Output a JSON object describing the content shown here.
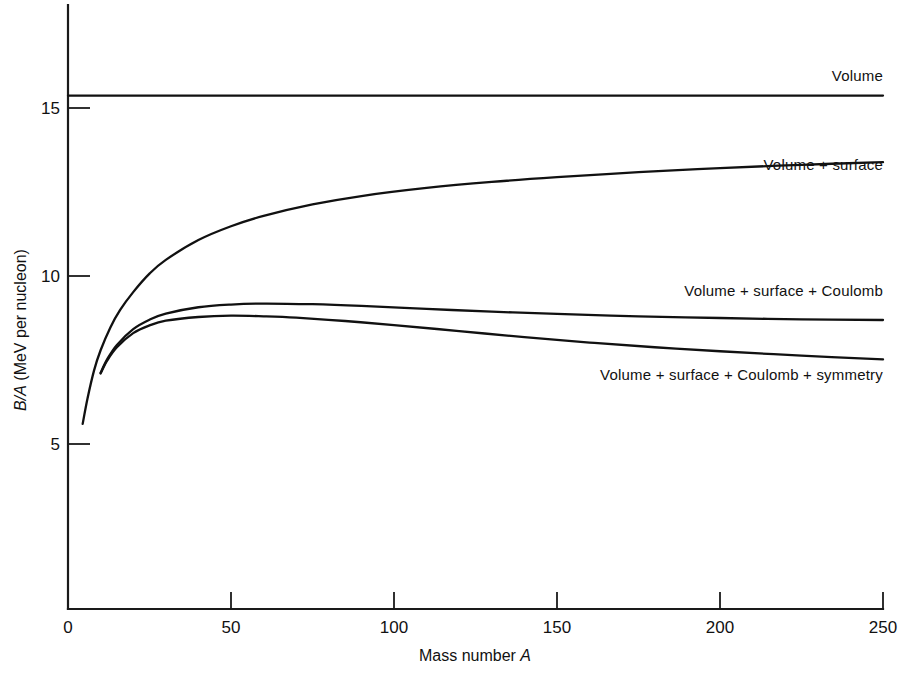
{
  "chart_data": {
    "type": "line",
    "title": "",
    "xlabel": "Mass number A",
    "ylabel": "B/A (MeV per nucleon)",
    "xlim": [
      0,
      250
    ],
    "ylim": [
      0,
      16.8
    ],
    "grid": false,
    "legend_position": "inline-right-of-curve",
    "xticks": [
      0,
      50,
      100,
      150,
      200,
      250
    ],
    "xtick_labels": [
      "0",
      "50",
      "100",
      "150",
      "200",
      "250"
    ],
    "yticks": [
      5,
      10,
      15
    ],
    "ytick_labels": [
      "5",
      "10",
      "15"
    ],
    "series": [
      {
        "name": "Volume",
        "label": "Volume",
        "label_anchor_x": 250,
        "label_value": 15.8,
        "x": [
          0,
          25,
          50,
          75,
          100,
          125,
          150,
          175,
          200,
          225,
          250
        ],
        "values": [
          15.37,
          15.37,
          15.37,
          15.37,
          15.37,
          15.37,
          15.37,
          15.37,
          15.37,
          15.37,
          15.37
        ]
      },
      {
        "name": "Volume + surface",
        "label": "Volume + surface",
        "label_anchor_x": 250,
        "label_value": 13.15,
        "x": [
          4.5,
          6,
          8,
          10,
          13,
          16,
          20,
          25,
          30,
          40,
          50,
          60,
          75,
          90,
          110,
          130,
          150,
          175,
          200,
          225,
          250
        ],
        "values": [
          5.6,
          6.36,
          7.19,
          7.79,
          8.47,
          8.99,
          9.52,
          10.07,
          10.48,
          11.07,
          11.48,
          11.79,
          12.13,
          12.38,
          12.62,
          12.8,
          12.94,
          13.09,
          13.21,
          13.31,
          13.39
        ]
      },
      {
        "name": "Volume + surface + Coulomb",
        "label": "Volume + surface + Coulomb",
        "label_anchor_x": 250,
        "label_value": 9.4,
        "x": [
          10,
          12,
          15,
          20,
          25,
          30,
          40,
          50,
          60,
          75,
          90,
          110,
          130,
          150,
          175,
          200,
          225,
          250
        ],
        "values": [
          7.12,
          7.52,
          7.95,
          8.42,
          8.7,
          8.88,
          9.07,
          9.15,
          9.18,
          9.16,
          9.11,
          9.02,
          8.94,
          8.87,
          8.8,
          8.75,
          8.71,
          8.69
        ]
      },
      {
        "name": "Volume + surface + Coulomb + symmetry",
        "label": "Volume + surface + Coulomb + symmetry",
        "label_anchor_x": 250,
        "label_value": 6.9,
        "x": [
          10,
          12,
          15,
          20,
          25,
          30,
          40,
          50,
          60,
          70,
          85,
          100,
          120,
          140,
          160,
          180,
          200,
          225,
          250
        ],
        "values": [
          7.1,
          7.48,
          7.88,
          8.3,
          8.53,
          8.67,
          8.78,
          8.82,
          8.8,
          8.76,
          8.66,
          8.54,
          8.36,
          8.18,
          8.02,
          7.88,
          7.76,
          7.63,
          7.52
        ]
      }
    ]
  },
  "axis": {
    "x_title_plain": "Mass number ",
    "x_title_italic": "A",
    "y_title_italic": "B/A",
    "y_title_plain": " (MeV per nucleon)"
  },
  "colors": {
    "background": "#ffffff",
    "ink": "#111111",
    "axis": "#1a1a1a"
  }
}
